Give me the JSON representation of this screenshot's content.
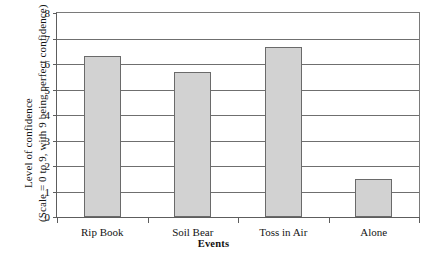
{
  "chart_data": {
    "type": "bar",
    "title": "",
    "categories": [
      "Rip Book",
      "Soil Bear",
      "Toss in Air",
      "Alone"
    ],
    "values": [
      6.3,
      5.7,
      6.65,
      1.5
    ],
    "series": [
      {
        "name": "Level of confidence",
        "values": [
          6.3,
          5.7,
          6.65,
          1.5
        ]
      }
    ],
    "xlabel": "Events",
    "ylabel_line1": "Level of confidence",
    "ylabel_line2": "(Scale = 0 to 9, with 9 being perfect confidence)",
    "ylim": [
      0,
      8
    ],
    "yticks": [
      0,
      1,
      2,
      3,
      4,
      5,
      6,
      7,
      8
    ],
    "ytick_labels": [
      "0",
      "1",
      "2",
      "3",
      "4",
      "5",
      "6",
      "7",
      "8"
    ],
    "grid": true,
    "legend": false,
    "bar_fill_color": "#d2d2d2",
    "bar_edge_color": "#6a6a6a",
    "axis_color": "#5d5d5d",
    "grid_color": "#6f6f6f",
    "background_color": "#ffffff"
  }
}
